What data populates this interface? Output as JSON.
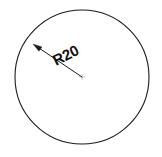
{
  "drawing": {
    "title": "Circle with radius dimension",
    "background_color": "#ffffff",
    "line_color": "#1b1b1b",
    "center_mark_color": "#b9b9b9",
    "text_color": "#111111"
  },
  "circle": {
    "name": "circle-outline",
    "center_x": 82,
    "center_y": 77,
    "radius_px": 67,
    "stroke_width": 1.1
  },
  "dimension": {
    "label": "R20",
    "radius_value": 20,
    "prefix": "R",
    "text_rotation_deg": -27,
    "text_x": 56,
    "text_y": 66,
    "leader": {
      "name": "radius-leader-line",
      "from_x": 33,
      "from_y": 44,
      "to_x": 82,
      "to_y": 77,
      "stroke_width": 1.0
    },
    "arrowhead": {
      "name": "leader-arrowhead",
      "tip_x": 33,
      "tip_y": 44,
      "angle_deg": 214,
      "length": 9,
      "half_width": 2.6
    }
  },
  "center_mark": {
    "name": "center-mark",
    "x": 82,
    "y": 77,
    "size": 3
  }
}
